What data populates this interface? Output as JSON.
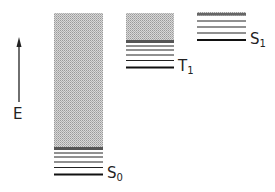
{
  "diagram": {
    "type": "energy-level-diagram",
    "axis": {
      "label": "E",
      "direction": "up"
    },
    "states": [
      {
        "name": "S",
        "subscript": "0",
        "label": "S0"
      },
      {
        "name": "T",
        "subscript": "1",
        "label": "T1"
      },
      {
        "name": "S",
        "subscript": "1",
        "label": "S1"
      }
    ],
    "colors": {
      "line": "#1a1a1a",
      "band": "#b8b8b8"
    }
  }
}
